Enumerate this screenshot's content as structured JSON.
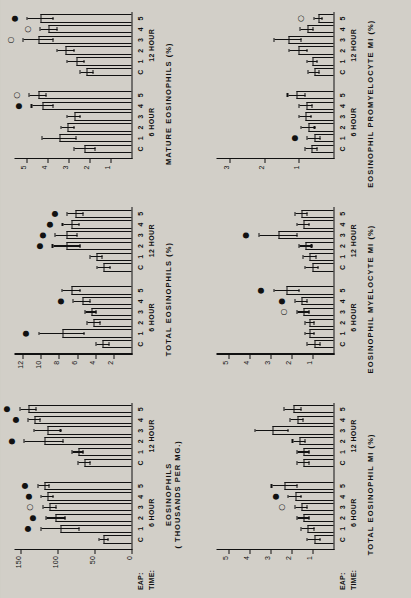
{
  "figure": {
    "orientation": "rotated-90",
    "row_headers": {
      "eap": "EAP:",
      "time": "TIME:"
    },
    "group_labels": [
      "6 HOUR",
      "12 HOUR"
    ],
    "category_labels": [
      "C",
      "1",
      "2",
      "3",
      "4",
      "5"
    ],
    "significance_glyphs": {
      "filled": "●",
      "open": "○"
    }
  },
  "chart_data": [
    {
      "id": "eosinophils-thousands",
      "type": "bar",
      "title": "EOSINOPHILS",
      "subtitle": "( THOUSANDS PER MG.)",
      "ylabel": "EOSINOPHILS ( THOUSANDS PER MG.)",
      "xlabel": "",
      "ylim": [
        0,
        160
      ],
      "yticks": [
        0,
        50,
        100,
        150
      ],
      "ytick_labels": [
        "0",
        "50",
        "100",
        "150"
      ],
      "grid": false,
      "categories": [
        "C",
        "1",
        "2",
        "3",
        "4",
        "5",
        "C",
        "1",
        "2",
        "3",
        "4",
        "5"
      ],
      "groups": [
        "6 HOUR",
        "6 HOUR",
        "6 HOUR",
        "6 HOUR",
        "6 HOUR",
        "6 HOUR",
        "12 HOUR",
        "12 HOUR",
        "12 HOUR",
        "12 HOUR",
        "12 HOUR",
        "12 HOUR"
      ],
      "values": [
        37,
        96,
        102,
        110,
        113,
        118,
        63,
        72,
        118,
        113,
        131,
        139
      ],
      "errors": [
        6,
        26,
        13,
        9,
        8,
        8,
        8,
        8,
        26,
        18,
        8,
        11
      ],
      "significance": [
        "",
        "●",
        "●",
        "○",
        "●",
        "●",
        "",
        "",
        "●",
        "",
        "●",
        "●"
      ]
    },
    {
      "id": "total-eosinophils-pct",
      "type": "bar",
      "title": "TOTAL EOSINOPHILS (%)",
      "subtitle": "",
      "ylabel": "TOTAL EOSINOPHILS (%)",
      "xlabel": "",
      "ylim": [
        0,
        13
      ],
      "yticks": [
        2,
        4,
        6,
        8,
        10,
        12
      ],
      "ytick_labels": [
        "2",
        "4",
        "6",
        "8",
        "10",
        "12"
      ],
      "grid": false,
      "categories": [
        "C",
        "1",
        "2",
        "3",
        "4",
        "5",
        "C",
        "1",
        "2",
        "3",
        "4",
        "5"
      ],
      "groups": [
        "6 HOUR",
        "6 HOUR",
        "6 HOUR",
        "6 HOUR",
        "6 HOUR",
        "6 HOUR",
        "12 HOUR",
        "12 HOUR",
        "12 HOUR",
        "12 HOUR",
        "12 HOUR",
        "12 HOUR"
      ],
      "values": [
        3.1,
        7.6,
        4.1,
        4.4,
        5.4,
        6.6,
        3.0,
        3.8,
        7.1,
        7.1,
        6.6,
        6.1
      ],
      "errors": [
        0.7,
        2.5,
        0.7,
        0.6,
        0.9,
        1.0,
        0.7,
        0.7,
        1.5,
        1.2,
        0.9,
        0.9
      ],
      "significance": [
        "",
        "●",
        "",
        "",
        "●",
        "",
        "",
        "",
        "●",
        "●",
        "●",
        "●"
      ]
    },
    {
      "id": "mature-eosinophils-pct",
      "type": "bar",
      "title": "MATURE EOSINOPHILS (%)",
      "subtitle": "",
      "ylabel": "MATURE EOSINOPHILS (%)",
      "xlabel": "",
      "ylim": [
        0,
        5.6
      ],
      "yticks": [
        1,
        2,
        3,
        4,
        5
      ],
      "ytick_labels": [
        "1",
        "2",
        "3",
        "4",
        "5"
      ],
      "grid": false,
      "categories": [
        "C",
        "1",
        "2",
        "3",
        "4",
        "5",
        "C",
        "1",
        "2",
        "3",
        "4",
        "5"
      ],
      "groups": [
        "6 HOUR",
        "6 HOUR",
        "6 HOUR",
        "6 HOUR",
        "6 HOUR",
        "6 HOUR",
        "12 HOUR",
        "12 HOUR",
        "12 HOUR",
        "12 HOUR",
        "12 HOUR",
        "12 HOUR"
      ],
      "values": [
        2.2,
        3.4,
        3.0,
        2.7,
        4.2,
        4.4,
        2.1,
        2.6,
        3.1,
        4.4,
        3.9,
        4.3
      ],
      "errors": [
        0.5,
        0.8,
        0.3,
        0.3,
        0.5,
        0.4,
        0.3,
        0.4,
        0.4,
        0.7,
        0.4,
        0.6
      ],
      "significance": [
        "",
        "",
        "",
        "",
        "●",
        "○",
        "",
        "",
        "",
        "○",
        "○",
        "●"
      ]
    },
    {
      "id": "total-eosinophil-mi-pct",
      "type": "bar",
      "title": "TOTAL EOSINOPHIL MI (%)",
      "subtitle": "",
      "ylabel": "TOTAL EOSINOPHIL MI (%)",
      "xlabel": "",
      "ylim": [
        0,
        5.6
      ],
      "yticks": [
        1,
        2,
        3,
        4,
        5
      ],
      "ytick_labels": [
        "1",
        "2",
        "3",
        "4",
        "5"
      ],
      "grid": false,
      "categories": [
        "C",
        "1",
        "2",
        "3",
        "4",
        "5",
        "C",
        "1",
        "2",
        "3",
        "4",
        "5"
      ],
      "groups": [
        "6 HOUR",
        "6 HOUR",
        "6 HOUR",
        "6 HOUR",
        "6 HOUR",
        "6 HOUR",
        "12 HOUR",
        "12 HOUR",
        "12 HOUR",
        "12 HOUR",
        "12 HOUR",
        "12 HOUR"
      ],
      "values": [
        0.9,
        1.2,
        1.4,
        1.5,
        1.8,
        2.3,
        1.4,
        1.4,
        1.6,
        2.9,
        1.7,
        1.9
      ],
      "errors": [
        0.3,
        0.3,
        0.3,
        0.3,
        0.3,
        0.6,
        0.3,
        0.3,
        0.3,
        0.8,
        0.3,
        0.4
      ],
      "significance": [
        "",
        "",
        "",
        "○",
        "●",
        "",
        "",
        "",
        "",
        "",
        "",
        ""
      ]
    },
    {
      "id": "eosinophil-myelocyte-mi-pct",
      "type": "bar",
      "title": "EOSINOPHIL MYELOCYTE MI (%)",
      "subtitle": "",
      "ylabel": "EOSINOPHIL MYELOCYTE MI (%)",
      "xlabel": "",
      "ylim": [
        0,
        5.6
      ],
      "yticks": [
        1,
        2,
        3,
        4,
        5
      ],
      "ytick_labels": [
        "1",
        "2",
        "3",
        "4",
        "5"
      ],
      "grid": false,
      "categories": [
        "C",
        "1",
        "2",
        "3",
        "4",
        "5",
        "C",
        "1",
        "2",
        "3",
        "4",
        "5"
      ],
      "groups": [
        "6 HOUR",
        "6 HOUR",
        "6 HOUR",
        "6 HOUR",
        "6 HOUR",
        "6 HOUR",
        "12 HOUR",
        "12 HOUR",
        "12 HOUR",
        "12 HOUR",
        "12 HOUR",
        "12 HOUR"
      ],
      "values": [
        0.9,
        1.1,
        1.1,
        1.4,
        1.5,
        2.2,
        1.0,
        1.1,
        1.3,
        2.6,
        1.4,
        1.5
      ],
      "errors": [
        0.3,
        0.2,
        0.2,
        0.3,
        0.3,
        0.6,
        0.3,
        0.3,
        0.3,
        0.9,
        0.3,
        0.3
      ],
      "significance": [
        "",
        "",
        "",
        "○",
        "●",
        "●",
        "",
        "",
        "",
        "●",
        "",
        ""
      ]
    },
    {
      "id": "eosinophil-promyelocyte-mi-pct",
      "type": "bar",
      "title": "EOSINOPHIL PROMYELOCYTE MI (%)",
      "subtitle": "",
      "ylabel": "EOSINOPHIL PROMYELOCYTE MI (%)",
      "xlabel": "",
      "ylim": [
        0,
        3.4
      ],
      "yticks": [
        1,
        2,
        3
      ],
      "ytick_labels": [
        "1",
        "2",
        "3"
      ],
      "grid": false,
      "categories": [
        "C",
        "1",
        "2",
        "3",
        "4",
        "5",
        "C",
        "1",
        "2",
        "3",
        "4",
        "5"
      ],
      "groups": [
        "6 HOUR",
        "6 HOUR",
        "6 HOUR",
        "6 HOUR",
        "6 HOUR",
        "6 HOUR",
        "12 HOUR",
        "12 HOUR",
        "12 HOUR",
        "12 HOUR",
        "12 HOUR",
        "12 HOUR"
      ],
      "values": [
        0.62,
        0.55,
        0.72,
        0.8,
        0.78,
        1.05,
        0.55,
        0.6,
        1.0,
        1.3,
        0.75,
        0.42
      ],
      "errors": [
        0.18,
        0.18,
        0.2,
        0.18,
        0.18,
        0.25,
        0.15,
        0.15,
        0.25,
        0.4,
        0.18,
        0.12
      ],
      "significance": [
        "",
        "●",
        "",
        "",
        "",
        "",
        "",
        "",
        "",
        "",
        "",
        "○"
      ]
    }
  ]
}
